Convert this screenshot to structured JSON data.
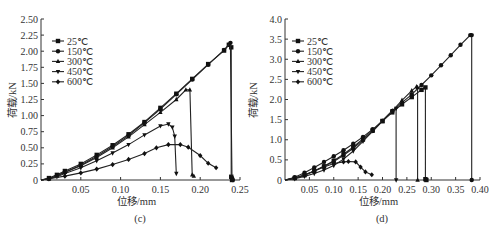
{
  "figure": {
    "background": "#ffffff",
    "ink": "#222222"
  },
  "chart_data": [
    {
      "type": "line",
      "panel_label": "(c)",
      "title": "",
      "xlabel": "位移/mm",
      "ylabel": "荷载/kN",
      "xlim": [
        0,
        0.25
      ],
      "ylim": [
        0,
        2.5
      ],
      "xticks": [
        "0.05",
        "0.10",
        "0.15",
        "0.20",
        "0.25"
      ],
      "yticks": [
        "0",
        "0.25",
        "0.50",
        "0.75",
        "1.00",
        "1.25",
        "1.50",
        "1.75",
        "2.00",
        "2.25",
        "2.50"
      ],
      "grid": false,
      "legend_position": "upper-left",
      "series": [
        {
          "name": "25℃",
          "marker": "square",
          "x": [
            0,
            0.01,
            0.02,
            0.03,
            0.05,
            0.07,
            0.09,
            0.11,
            0.13,
            0.15,
            0.17,
            0.19,
            0.21,
            0.23,
            0.236,
            0.239,
            0.239,
            0.24
          ],
          "y": [
            0,
            0.03,
            0.08,
            0.14,
            0.25,
            0.39,
            0.54,
            0.71,
            0.9,
            1.12,
            1.34,
            1.57,
            1.8,
            2.01,
            2.1,
            2.06,
            0.05,
            0
          ]
        },
        {
          "name": "150℃",
          "marker": "circle",
          "x": [
            0,
            0.01,
            0.02,
            0.03,
            0.05,
            0.07,
            0.09,
            0.11,
            0.13,
            0.15,
            0.17,
            0.19,
            0.21,
            0.23,
            0.238,
            0.24,
            0.241
          ],
          "y": [
            0,
            0.02,
            0.07,
            0.12,
            0.23,
            0.37,
            0.52,
            0.69,
            0.89,
            1.1,
            1.33,
            1.56,
            1.79,
            2.02,
            2.13,
            0.03,
            0
          ]
        },
        {
          "name": "300℃",
          "marker": "triangle-up",
          "x": [
            0,
            0.01,
            0.02,
            0.03,
            0.05,
            0.07,
            0.09,
            0.11,
            0.13,
            0.15,
            0.17,
            0.182,
            0.187,
            0.19,
            0.192
          ],
          "y": [
            0,
            0.02,
            0.06,
            0.12,
            0.22,
            0.35,
            0.5,
            0.67,
            0.86,
            1.05,
            1.25,
            1.4,
            1.4,
            0.08,
            0.06
          ]
        },
        {
          "name": "450℃",
          "marker": "triangle-down",
          "x": [
            0,
            0.01,
            0.02,
            0.03,
            0.05,
            0.07,
            0.09,
            0.11,
            0.13,
            0.15,
            0.16,
            0.165,
            0.168,
            0.17
          ],
          "y": [
            0,
            0.02,
            0.05,
            0.1,
            0.19,
            0.3,
            0.42,
            0.55,
            0.7,
            0.84,
            0.87,
            0.82,
            0.68,
            0.1
          ]
        },
        {
          "name": "600℃",
          "marker": "diamond",
          "x": [
            0,
            0.01,
            0.03,
            0.05,
            0.07,
            0.09,
            0.11,
            0.13,
            0.145,
            0.16,
            0.175,
            0.185,
            0.2,
            0.21,
            0.22
          ],
          "y": [
            0,
            0.02,
            0.06,
            0.11,
            0.17,
            0.24,
            0.32,
            0.41,
            0.5,
            0.55,
            0.55,
            0.51,
            0.38,
            0.26,
            0.19
          ]
        }
      ]
    },
    {
      "type": "line",
      "panel_label": "(d)",
      "title": "",
      "xlabel": "位移/mm",
      "ylabel": "荷载/kN",
      "xlim": [
        0,
        0.4
      ],
      "ylim": [
        0,
        4.0
      ],
      "xticks": [
        "0.05",
        "0.10",
        "0.15",
        "0.20",
        "0.25",
        "0.30",
        "0.35",
        "0.40"
      ],
      "yticks": [
        "0",
        "0.5",
        "1.0",
        "1.5",
        "2.0",
        "2.5",
        "3.0",
        "3.5",
        "4.0"
      ],
      "grid": false,
      "legend_position": "upper-left",
      "series": [
        {
          "name": "25℃",
          "marker": "square",
          "x": [
            0,
            0.02,
            0.04,
            0.06,
            0.08,
            0.1,
            0.12,
            0.14,
            0.16,
            0.18,
            0.2,
            0.22,
            0.24,
            0.26,
            0.28,
            0.288,
            0.288,
            0.29
          ],
          "y": [
            0,
            0.05,
            0.12,
            0.22,
            0.34,
            0.48,
            0.64,
            0.82,
            1.02,
            1.24,
            1.46,
            1.68,
            1.88,
            2.06,
            2.24,
            2.3,
            0.02,
            0
          ]
        },
        {
          "name": "150℃",
          "marker": "circle",
          "x": [
            0,
            0.02,
            0.04,
            0.06,
            0.08,
            0.1,
            0.12,
            0.14,
            0.16,
            0.18,
            0.2,
            0.22,
            0.24,
            0.26,
            0.28,
            0.3,
            0.32,
            0.34,
            0.36,
            0.38,
            0.383,
            0.383
          ],
          "y": [
            0,
            0.07,
            0.18,
            0.31,
            0.45,
            0.59,
            0.74,
            0.9,
            1.07,
            1.26,
            1.47,
            1.7,
            1.92,
            2.13,
            2.36,
            2.6,
            2.85,
            3.1,
            3.36,
            3.6,
            3.6,
            0
          ]
        },
        {
          "name": "300℃",
          "marker": "triangle-up",
          "x": [
            0,
            0.02,
            0.04,
            0.06,
            0.08,
            0.1,
            0.12,
            0.14,
            0.16,
            0.18,
            0.2,
            0.22,
            0.24,
            0.26,
            0.27,
            0.272,
            0.272
          ],
          "y": [
            0,
            0.04,
            0.12,
            0.22,
            0.34,
            0.46,
            0.61,
            0.79,
            0.99,
            1.21,
            1.46,
            1.72,
            1.98,
            2.22,
            2.32,
            2.3,
            0
          ]
        },
        {
          "name": "450℃",
          "marker": "triangle-down",
          "x": [
            0,
            0.02,
            0.04,
            0.06,
            0.08,
            0.1,
            0.12,
            0.14,
            0.16,
            0.18,
            0.2,
            0.22,
            0.228,
            0.228
          ],
          "y": [
            0,
            0.03,
            0.09,
            0.16,
            0.25,
            0.36,
            0.52,
            0.72,
            0.96,
            1.22,
            1.48,
            1.72,
            1.78,
            0
          ]
        },
        {
          "name": "600℃",
          "marker": "diamond",
          "x": [
            0,
            0.02,
            0.04,
            0.06,
            0.08,
            0.1,
            0.12,
            0.13,
            0.145,
            0.155,
            0.165,
            0.178
          ],
          "y": [
            0,
            0.05,
            0.13,
            0.22,
            0.32,
            0.41,
            0.45,
            0.46,
            0.45,
            0.32,
            0.2,
            0.13
          ]
        }
      ]
    }
  ]
}
